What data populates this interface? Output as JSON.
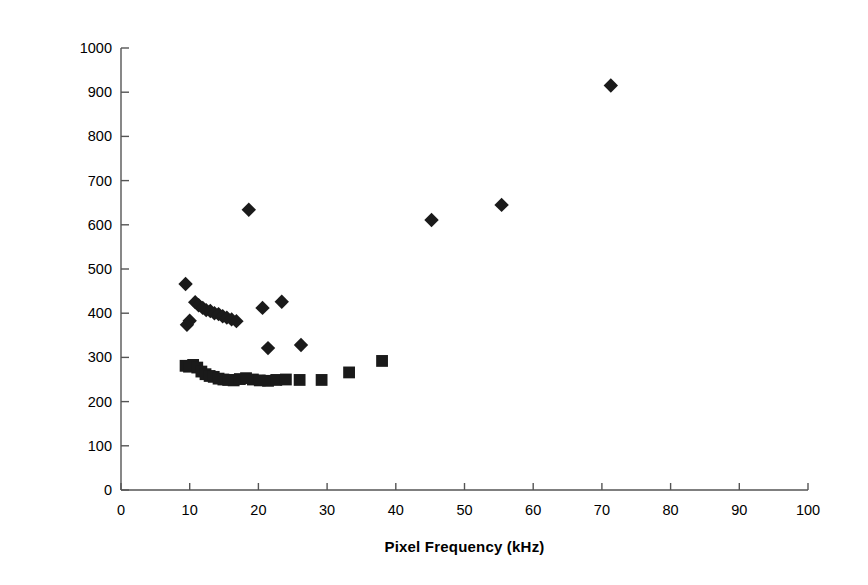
{
  "chart_data": {
    "type": "scatter",
    "title": "",
    "xlabel": "Pixel Frequency (kHz)",
    "ylabel": "Read Noise (carriers)",
    "xlim": [
      0,
      100
    ],
    "ylim": [
      0,
      1000
    ],
    "xticks": [
      0,
      10,
      20,
      30,
      40,
      50,
      60,
      70,
      80,
      90,
      100
    ],
    "yticks": [
      0,
      100,
      200,
      300,
      400,
      500,
      600,
      700,
      800,
      900,
      1000
    ],
    "grid": false,
    "legend": "none",
    "marker_color": "#1a1a1a",
    "axis_color": "#555555",
    "series": [
      {
        "name": "Read noise - diamonds",
        "marker": "diamond",
        "points": [
          [
            9.4,
            466
          ],
          [
            9.6,
            374
          ],
          [
            10.0,
            383
          ],
          [
            10.8,
            425
          ],
          [
            11.3,
            418
          ],
          [
            11.9,
            412
          ],
          [
            12.4,
            407
          ],
          [
            13.0,
            405
          ],
          [
            13.6,
            400
          ],
          [
            14.2,
            398
          ],
          [
            14.8,
            393
          ],
          [
            15.4,
            390
          ],
          [
            16.1,
            386
          ],
          [
            16.8,
            382
          ],
          [
            18.6,
            634
          ],
          [
            20.6,
            412
          ],
          [
            21.4,
            321
          ],
          [
            23.4,
            426
          ],
          [
            26.2,
            328
          ],
          [
            45.2,
            611
          ],
          [
            55.4,
            645
          ],
          [
            71.3,
            915
          ]
        ]
      },
      {
        "name": "Read noise - squares",
        "marker": "square",
        "points": [
          [
            9.4,
            281
          ],
          [
            9.9,
            279
          ],
          [
            10.5,
            283
          ],
          [
            11.1,
            277
          ],
          [
            11.7,
            268
          ],
          [
            12.3,
            262
          ],
          [
            12.9,
            258
          ],
          [
            13.5,
            256
          ],
          [
            14.2,
            252
          ],
          [
            14.9,
            250
          ],
          [
            15.6,
            249
          ],
          [
            16.4,
            248
          ],
          [
            17.3,
            251
          ],
          [
            18.2,
            253
          ],
          [
            19.2,
            250
          ],
          [
            20.2,
            248
          ],
          [
            21.4,
            247
          ],
          [
            22.6,
            249
          ],
          [
            24.0,
            250
          ],
          [
            26.0,
            249
          ],
          [
            29.2,
            249
          ],
          [
            33.2,
            266
          ],
          [
            38.0,
            292
          ]
        ]
      }
    ]
  },
  "axes": {
    "x_tick_labels": [
      "0",
      "10",
      "20",
      "30",
      "40",
      "50",
      "60",
      "70",
      "80",
      "90",
      "100"
    ],
    "y_tick_labels": [
      "0",
      "100",
      "200",
      "300",
      "400",
      "500",
      "600",
      "700",
      "800",
      "900",
      "1000"
    ],
    "x_axis_title": "Pixel Frequency (kHz)",
    "y_axis_title": "Read Noise (carriers)"
  }
}
